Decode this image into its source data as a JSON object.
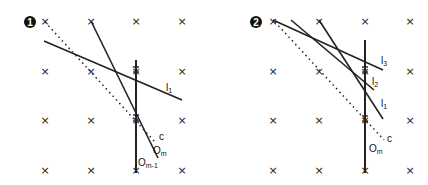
{
  "panels": [
    {
      "id": "panel-1",
      "badge": "1",
      "labels": {
        "l1": {
          "main": "l",
          "sub": "1"
        },
        "c": {
          "main": "c",
          "sub": ""
        },
        "om": {
          "main": "O",
          "sub": "m"
        },
        "om1": {
          "main": "O",
          "sub": "m-1"
        }
      }
    },
    {
      "id": "panel-2",
      "badge": "2",
      "labels": {
        "l3": {
          "main": "l",
          "sub": "3"
        },
        "l2": {
          "main": "l",
          "sub": "2"
        },
        "l1": {
          "main": "l",
          "sub": "1"
        },
        "c": {
          "main": "c",
          "sub": ""
        },
        "om": {
          "main": "O",
          "sub": "m"
        }
      }
    }
  ],
  "grid_marker": "×",
  "colors": {
    "line": "#222222",
    "marker": "#222222",
    "badge": "#111111"
  }
}
